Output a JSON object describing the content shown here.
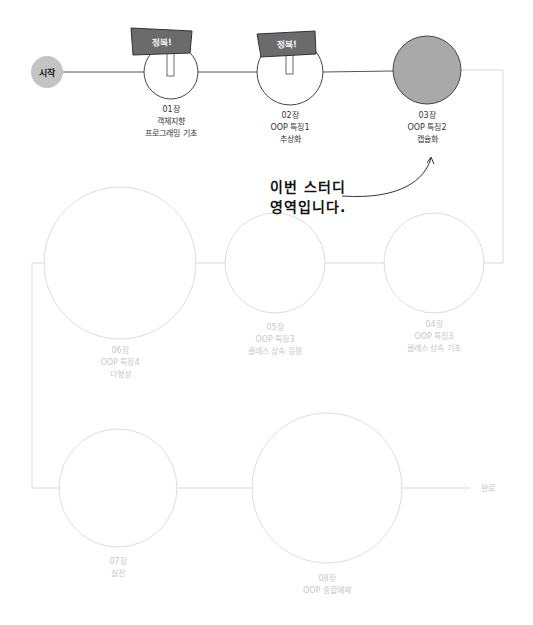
{
  "start": {
    "label": "시작"
  },
  "end": {
    "label": "완료"
  },
  "note": {
    "line1": "이번 스터디",
    "line2": "영역입니다."
  },
  "sign_label": "정복!",
  "colors": {
    "done_line": "#555555",
    "todo_line": "#d9d9d9",
    "current_fill": "#a9a9a9",
    "sign_fill": "#6b6b6b",
    "start_fill": "#c4c4c4"
  },
  "stages": [
    {
      "chapter": "01장",
      "line2": "객체지향",
      "line3": "프로그래밍 기초",
      "status": "conquered"
    },
    {
      "chapter": "02장",
      "line2": "OOP 특징1",
      "line3": "추상화",
      "status": "conquered"
    },
    {
      "chapter": "03장",
      "line2": "OOP 특징2",
      "line3": "캡슐화",
      "status": "current"
    },
    {
      "chapter": "04장",
      "line2": "OOP 특징3",
      "line3": "클래스 상속 기초",
      "status": "upcoming"
    },
    {
      "chapter": "05장",
      "line2": "OOP 특징3",
      "line3": "클래스 상속 응용",
      "status": "upcoming"
    },
    {
      "chapter": "06장",
      "line2": "OOP 특징4",
      "line3": "다형성",
      "status": "upcoming"
    },
    {
      "chapter": "07장",
      "line2": "실전",
      "status": "upcoming"
    },
    {
      "chapter": "08장",
      "line2": "OOP 종합예제",
      "status": "upcoming"
    }
  ]
}
